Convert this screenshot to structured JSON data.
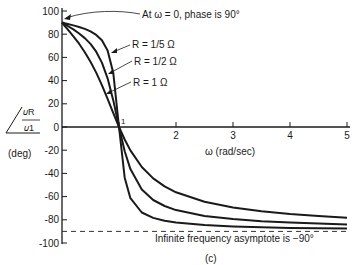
{
  "chart_data": {
    "type": "line",
    "title": "",
    "caption": "(c)",
    "xlabel": "ω (rad/sec)",
    "ylabel": {
      "numerator": "𝜐R",
      "denominator": "𝜐1",
      "angle_symbol": "∠",
      "unit": "(deg)"
    },
    "xlim": [
      0,
      5
    ],
    "ylim": [
      -100,
      100
    ],
    "x_ticks": [
      1,
      2,
      3,
      4,
      5
    ],
    "x_tick_labels": [
      "1",
      "2",
      "3",
      "4",
      "5"
    ],
    "y_ticks": [
      100,
      80,
      60,
      40,
      20,
      0,
      -20,
      -40,
      -60,
      -80,
      -100
    ],
    "y_tick_labels": [
      "100",
      "80",
      "60",
      "40",
      "20",
      "0",
      "-20",
      "-40",
      "-60",
      "-80",
      "-100"
    ],
    "grid": false,
    "x": [
      0.02,
      0.05,
      0.1,
      0.2,
      0.3,
      0.4,
      0.5,
      0.6,
      0.7,
      0.8,
      0.9,
      1.0,
      1.1,
      1.2,
      1.4,
      1.6,
      1.8,
      2.0,
      2.5,
      3.0,
      3.5,
      4.0,
      4.5,
      5.0
    ],
    "series": [
      {
        "name": "R = 1 Ω",
        "values": [
          88.9,
          87.1,
          84.2,
          78.2,
          71.8,
          64.5,
          56.3,
          46.9,
          36.1,
          24.2,
          11.9,
          0,
          -10.8,
          -20.2,
          -34.5,
          -44.3,
          -51.2,
          -56.3,
          -64.5,
          -69.4,
          -72.7,
          -75.1,
          -76.8,
          -78.2
        ]
      },
      {
        "name": "R = 1/2 Ω",
        "values": [
          89.4,
          88.6,
          87.1,
          84.1,
          80.6,
          76.6,
          71.6,
          64.9,
          55.5,
          42.0,
          22.9,
          0,
          -20.9,
          -36.3,
          -53.9,
          -62.9,
          -68.1,
          -71.6,
          -76.6,
          -79.4,
          -81.2,
          -82.4,
          -83.3,
          -84.0
        ]
      },
      {
        "name": "R = 1/5 Ω",
        "values": [
          89.8,
          89.4,
          88.8,
          87.6,
          86.2,
          84.6,
          82.4,
          79.4,
          74.7,
          66.0,
          46.5,
          0,
          -43.7,
          -61.4,
          -73.7,
          -78.4,
          -80.9,
          -82.4,
          -84.6,
          -85.7,
          -86.4,
          -87.0,
          -87.3,
          -87.6
        ]
      }
    ],
    "asymptote": {
      "y": -90,
      "style": "dashed",
      "label": "Infinite frequency asymptote is −90°"
    },
    "annotations": [
      {
        "text": "At ω = 0, phase is 90°",
        "points_to": [
          0,
          90
        ]
      },
      {
        "text": "R = 1/5 Ω",
        "points_to_series": "R = 1/5 Ω"
      },
      {
        "text": "R = 1/2 Ω",
        "points_to_series": "R = 1/2 Ω"
      },
      {
        "text": "R = 1 Ω",
        "points_to_series": "R = 1 Ω"
      },
      {
        "text": "1",
        "at": [
          1,
          0
        ]
      }
    ],
    "colors": {
      "line": "#1a1a1a",
      "background": "#ffffff"
    }
  }
}
